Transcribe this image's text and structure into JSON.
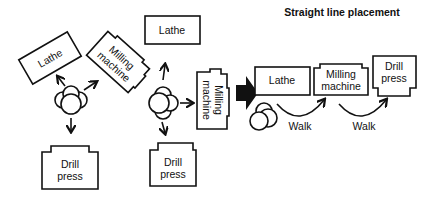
{
  "title": "Straight line placement",
  "layouts": [
    {
      "name": "triangular",
      "machines": [
        "Lathe",
        "Milling machine",
        "Drill press"
      ],
      "worker": "operator"
    },
    {
      "name": "compact",
      "machines": [
        "Lathe",
        "Milling machine",
        "Drill press"
      ],
      "worker": "operator"
    },
    {
      "name": "straight-line",
      "machines": [
        "Lathe",
        "Milling machine",
        "Drill press"
      ],
      "walk_labels": [
        "Walk",
        "Walk"
      ],
      "worker": "operator"
    }
  ],
  "labels": {
    "lathe": "Lathe",
    "milling_1": "Milling",
    "milling_2": "machine",
    "drill_1": "Drill",
    "drill_2": "press",
    "walk": "Walk"
  }
}
